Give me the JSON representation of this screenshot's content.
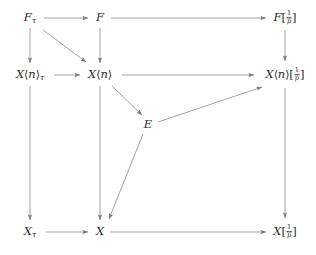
{
  "diagram": {
    "kind": "commutative-diagram",
    "line_color": "#9a9a9a",
    "text_color": "#2b2b2b",
    "background": "#ffffff",
    "nodes": [
      {
        "id": "F-tau",
        "base": "F",
        "sub": "τ",
        "localized": false,
        "x": 30,
        "y": 18
      },
      {
        "id": "F",
        "base": "F",
        "sub": "",
        "localized": false,
        "x": 100,
        "y": 18
      },
      {
        "id": "F-inv-p",
        "base": "F",
        "sub": "",
        "localized": true,
        "x": 285,
        "y": 18
      },
      {
        "id": "Xn-tau",
        "base": "X",
        "angle": "n",
        "sub": "τ",
        "localized": false,
        "x": 30,
        "y": 75
      },
      {
        "id": "Xn",
        "base": "X",
        "angle": "n",
        "sub": "",
        "localized": false,
        "x": 100,
        "y": 75
      },
      {
        "id": "Xn-inv-p",
        "base": "X",
        "angle": "n",
        "sub": "",
        "localized": true,
        "x": 285,
        "y": 75
      },
      {
        "id": "E",
        "base": "E",
        "sub": "",
        "localized": false,
        "x": 148,
        "y": 125
      },
      {
        "id": "X-tau",
        "base": "X",
        "sub": "τ",
        "localized": false,
        "x": 30,
        "y": 232
      },
      {
        "id": "X",
        "base": "X",
        "sub": "",
        "localized": false,
        "x": 100,
        "y": 232
      },
      {
        "id": "X-inv-p",
        "base": "X",
        "sub": "",
        "localized": true,
        "x": 285,
        "y": 232
      }
    ],
    "node_labels": {
      "F-tau": "Fτ",
      "F": "F",
      "F-inv-p": "F[1/p]",
      "Xn-tau": "X⟨n⟩τ",
      "Xn": "X⟨n⟩",
      "Xn-inv-p": "X⟨n⟩[1/p]",
      "E": "E",
      "X-tau": "Xτ",
      "X": "X",
      "X-inv-p": "X[1/p]"
    },
    "fraction": {
      "numerator": "1",
      "denominator": "p"
    },
    "angle_bracket_open": "⟨",
    "angle_bracket_close": "⟩",
    "bracket_open": "[",
    "bracket_close": "]",
    "edges": [
      {
        "id": "e-Ftau-F",
        "from": "F-tau",
        "to": "F",
        "x1": 44,
        "y1": 18,
        "x2": 88,
        "y2": 18,
        "label": ""
      },
      {
        "id": "e-F-Finvp",
        "from": "F",
        "to": "F-inv-p",
        "x1": 111,
        "y1": 18,
        "x2": 266,
        "y2": 18,
        "label": ""
      },
      {
        "id": "e-Ftau-Xntau",
        "from": "F-tau",
        "to": "Xn-tau",
        "x1": 30,
        "y1": 28,
        "x2": 30,
        "y2": 63,
        "label": ""
      },
      {
        "id": "e-F-Xn",
        "from": "F",
        "to": "Xn",
        "x1": 100,
        "y1": 28,
        "x2": 100,
        "y2": 63,
        "label": ""
      },
      {
        "id": "e-Finvp-Xninvp",
        "from": "F-inv-p",
        "to": "Xn-inv-p",
        "x1": 285,
        "y1": 30,
        "x2": 285,
        "y2": 61,
        "label": ""
      },
      {
        "id": "e-Ftau-Xn",
        "from": "F-tau",
        "to": "Xn",
        "x1": 43,
        "y1": 30,
        "x2": 86,
        "y2": 62,
        "label": ""
      },
      {
        "id": "e-Xntau-Xn",
        "from": "Xn-tau",
        "to": "Xn",
        "x1": 54,
        "y1": 75,
        "x2": 80,
        "y2": 75,
        "label": ""
      },
      {
        "id": "e-Xn-Xninvp",
        "from": "Xn",
        "to": "Xn-inv-p",
        "x1": 122,
        "y1": 75,
        "x2": 254,
        "y2": 75,
        "label": ""
      },
      {
        "id": "e-Xn-E",
        "from": "Xn",
        "to": "E",
        "x1": 112,
        "y1": 86,
        "x2": 142,
        "y2": 115,
        "label": ""
      },
      {
        "id": "e-E-Xninvp",
        "from": "E",
        "to": "Xn-inv-p",
        "x1": 158,
        "y1": 122,
        "x2": 262,
        "y2": 87,
        "label": ""
      },
      {
        "id": "e-E-X",
        "from": "E",
        "to": "X",
        "x1": 143,
        "y1": 134,
        "x2": 109,
        "y2": 219,
        "label": ""
      },
      {
        "id": "e-Xntau-Xtau",
        "from": "Xn-tau",
        "to": "X-tau",
        "x1": 30,
        "y1": 86,
        "x2": 30,
        "y2": 220,
        "label": ""
      },
      {
        "id": "e-Xn-X",
        "from": "Xn",
        "to": "X",
        "x1": 100,
        "y1": 86,
        "x2": 100,
        "y2": 220,
        "label": ""
      },
      {
        "id": "e-Xninvp-Xinvp",
        "from": "Xn-inv-p",
        "to": "X-inv-p",
        "x1": 285,
        "y1": 88,
        "x2": 285,
        "y2": 218,
        "label": ""
      },
      {
        "id": "e-Xtau-X",
        "from": "X-tau",
        "to": "X",
        "x1": 46,
        "y1": 232,
        "x2": 88,
        "y2": 232,
        "label": ""
      },
      {
        "id": "e-X-Xinvp",
        "from": "X",
        "to": "X-inv-p",
        "x1": 110,
        "y1": 232,
        "x2": 266,
        "y2": 232,
        "label": ""
      }
    ]
  }
}
